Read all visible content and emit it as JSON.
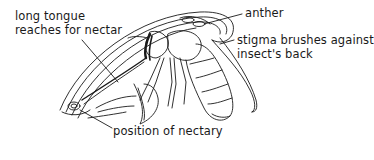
{
  "diagram": {
    "labels": {
      "tongue_line1": "long tongue",
      "tongue_line2": "reaches for nectar",
      "anther": "anther",
      "stigma_line1": "stigma brushes against",
      "stigma_line2": "insect's back",
      "nectary": "position of nectary"
    },
    "colors": {
      "line": "#1a1a1a",
      "background": "#ffffff"
    }
  }
}
